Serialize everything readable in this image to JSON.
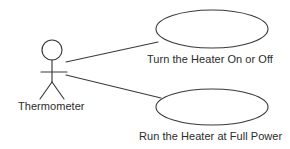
{
  "diagram": {
    "type": "uml-use-case-diagram",
    "canvas": {
      "width": 290,
      "height": 149,
      "background_color": "#ffffff"
    },
    "stroke_color": "#3a3a3a",
    "text_color": "#2b2b2b",
    "actors": [
      {
        "name": "actor-thermometer",
        "label": "Thermometer",
        "shape": "stick-figure",
        "position": {
          "x": 52,
          "y": 70
        }
      }
    ],
    "use_cases": [
      {
        "name": "use-case-turn-heater-on-or-off",
        "label": "Turn the Heater On or Off",
        "shape": "ellipse",
        "center": {
          "x": 212,
          "y": 29
        },
        "radius": {
          "x": 56,
          "y": 19
        }
      },
      {
        "name": "use-case-run-heater-full-power",
        "label": "Run the Heater at Full Power",
        "shape": "ellipse",
        "center": {
          "x": 212,
          "y": 107
        },
        "radius": {
          "x": 56,
          "y": 18
        }
      }
    ],
    "associations": [
      {
        "name": "association-thermometer-to-turn-heater",
        "from": "actor-thermometer",
        "to": "use-case-turn-heater-on-or-off",
        "from_point": {
          "x": 66,
          "y": 62
        },
        "to_point": {
          "x": 158,
          "y": 42
        }
      },
      {
        "name": "association-thermometer-to-run-heater",
        "from": "actor-thermometer",
        "to": "use-case-run-heater-full-power",
        "from_point": {
          "x": 66,
          "y": 75
        },
        "to_point": {
          "x": 161,
          "y": 98
        }
      }
    ]
  }
}
